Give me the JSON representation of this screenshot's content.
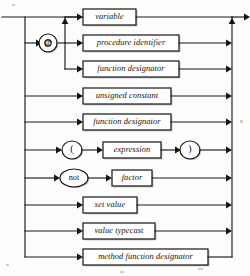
{
  "diagram": {
    "kind": "syntax-railroad-diagram",
    "title": "factor",
    "canvas": {
      "width": 250,
      "height": 276
    },
    "background_color": "#fdfdfb",
    "line_color": "#141414",
    "box_fill": "#ffffff",
    "shadow_color": "#8e8e8e",
    "entry": {
      "x": 2,
      "y": 17
    },
    "exit": {
      "x": 248,
      "y": 17
    },
    "left_rail_x": 25,
    "branch_rail_x": 65,
    "right_rail_x": 232,
    "rows": [
      {
        "id": "row-variable",
        "y": 17,
        "label": "variable",
        "shape": "box",
        "box": {
          "x": 83,
          "y": 9,
          "w": 53,
          "h": 16
        },
        "via_at_branch": true
      },
      {
        "id": "row-procedure-identifier",
        "y": 43,
        "label": "procedure identifier",
        "shape": "box",
        "box": {
          "x": 83,
          "y": 35,
          "w": 96,
          "h": 16
        },
        "via_at_branch": true
      },
      {
        "id": "row-function-designator-1",
        "y": 69,
        "label": "function designator",
        "shape": "box",
        "box": {
          "x": 83,
          "y": 61,
          "w": 96,
          "h": 16
        },
        "via_at_branch": true
      },
      {
        "id": "row-unsigned-constant",
        "y": 96,
        "label": "unsigned constant",
        "shape": "box",
        "box": {
          "x": 83,
          "y": 88,
          "w": 88,
          "h": 16
        },
        "via_at_branch": false
      },
      {
        "id": "row-function-designator-2",
        "y": 122,
        "label": "function designator",
        "shape": "box",
        "box": {
          "x": 83,
          "y": 114,
          "w": 88,
          "h": 16
        },
        "via_at_branch": false
      },
      {
        "id": "row-parenthesized-expression",
        "y": 150,
        "label": "expression",
        "shape": "box-with-terminals",
        "box": {
          "x": 103,
          "y": 142,
          "w": 58,
          "h": 16
        },
        "left_terminal": "(",
        "right_terminal": ")",
        "via_at_branch": false
      },
      {
        "id": "row-not-factor",
        "y": 178,
        "label": "factor",
        "shape": "keyword-then-box",
        "box": {
          "x": 112,
          "y": 170,
          "w": 40,
          "h": 16
        },
        "keyword": "not",
        "via_at_branch": false
      },
      {
        "id": "row-set-value",
        "y": 205,
        "label": "set value",
        "shape": "box",
        "box": {
          "x": 83,
          "y": 197,
          "w": 54,
          "h": 16
        },
        "via_at_branch": false
      },
      {
        "id": "row-value-typecast",
        "y": 231,
        "label": "value typecast",
        "shape": "box",
        "box": {
          "x": 83,
          "y": 223,
          "w": 72,
          "h": 16
        },
        "via_at_branch": false
      },
      {
        "id": "row-method-function-designator",
        "y": 257,
        "label": "method function designator",
        "shape": "box",
        "box": {
          "x": 83,
          "y": 249,
          "w": 125,
          "h": 16
        },
        "via_at_branch": false
      }
    ],
    "at_node": {
      "id": "at-terminal",
      "label": "@",
      "cx": 48,
      "cy": 43,
      "r": 9
    },
    "terminals": [
      {
        "id": "lparen-terminal",
        "label": "(",
        "cx": 72,
        "cy": 150,
        "rx": 10,
        "ry": 9
      },
      {
        "id": "rparen-terminal",
        "label": ")",
        "cx": 190,
        "cy": 150,
        "rx": 10,
        "ry": 9
      },
      {
        "id": "not-terminal",
        "label": "not",
        "cx": 74,
        "cy": 178,
        "rx": 14,
        "ry": 9
      }
    ]
  }
}
